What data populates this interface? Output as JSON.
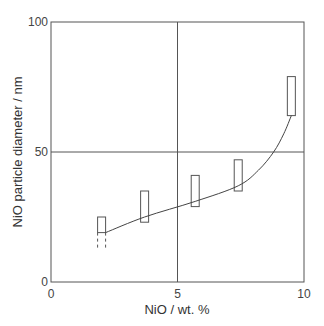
{
  "chart_data": {
    "type": "line",
    "title": "",
    "xlabel": "NiO / wt. %",
    "ylabel": "NiO particle diameter / nm",
    "xlim": [
      0,
      10
    ],
    "ylim": [
      0,
      100
    ],
    "x_ticks": [
      "0",
      "5",
      "10"
    ],
    "y_ticks": [
      "0",
      "50",
      "100"
    ],
    "grid": {
      "x": [
        5
      ],
      "y": [
        50
      ]
    },
    "legend": null,
    "series": [
      {
        "name": "range bars",
        "style": "open-rectangle",
        "points": [
          {
            "x": 2.0,
            "y_low": 19,
            "y_high": 25,
            "dashed_extension_to": 13
          },
          {
            "x": 3.7,
            "y_low": 23,
            "y_high": 35
          },
          {
            "x": 5.7,
            "y_low": 29,
            "y_high": 41
          },
          {
            "x": 7.4,
            "y_low": 35,
            "y_high": 47
          },
          {
            "x": 9.5,
            "y_low": 64,
            "y_high": 79
          }
        ]
      },
      {
        "name": "trend curve",
        "style": "line",
        "x": [
          2.0,
          3.7,
          5.7,
          7.4,
          8.2,
          8.8,
          9.2,
          9.5
        ],
        "y": [
          19,
          25,
          31,
          37,
          43,
          50,
          57,
          64
        ]
      }
    ]
  }
}
